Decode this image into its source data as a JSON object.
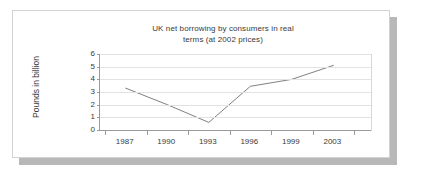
{
  "card": {
    "background_color": "#ffffff",
    "border_color": "#d2d2d2",
    "shadow_color": "#b8b8b8"
  },
  "chart_data": {
    "type": "line",
    "title": "UK net borrowing by consumers in real terms (at 2002 prices)",
    "title_lines": [
      "UK net borrowing by consumers in real",
      "terms (at 2002 prices)"
    ],
    "xlabel": "",
    "ylabel": "Pounds in billion",
    "categories": [
      "1987",
      "1990",
      "1993",
      "1996",
      "1999",
      "2003"
    ],
    "values": [
      3.3,
      2.0,
      0.6,
      3.45,
      4.0,
      5.1
    ],
    "series": [
      {
        "name": "UK net borrowing",
        "values": [
          3.3,
          2.0,
          0.6,
          3.45,
          4.0,
          5.1
        ],
        "color": "#808080"
      }
    ],
    "ylim": [
      0,
      6
    ],
    "yticks": [
      0,
      1,
      2,
      3,
      4,
      5,
      6
    ],
    "ytick_labels": [
      "0",
      "1",
      "2",
      "3",
      "4",
      "5",
      "6"
    ],
    "grid": true,
    "grid_color": "#e2e2e2",
    "legend": false,
    "legend_position": "none",
    "axis_color": "#9a9a9a",
    "text_color": "#3a3a3a",
    "markers": false
  }
}
